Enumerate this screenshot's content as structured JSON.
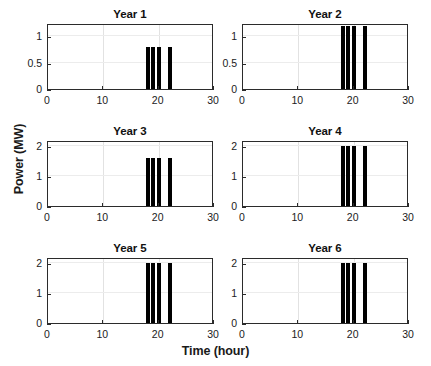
{
  "figure": {
    "xlabel": "Time (hour)",
    "ylabel": "Power (MW)",
    "bar_color": "#000000",
    "axis_color": "#2b2b2b",
    "grid_color": "#e2e2e2",
    "background": "#ffffff"
  },
  "chart_data": {
    "type": "bar",
    "title": "",
    "xlabel": "Time (hour)",
    "ylabel": "Power (MW)",
    "xlim": [
      0,
      30
    ],
    "grid": true,
    "legend": "none",
    "layout": "2 columns x 3 rows of subplots",
    "shared_xticks": [
      0,
      10,
      20,
      30
    ],
    "x": [
      18,
      19,
      20,
      22
    ],
    "panels": [
      {
        "title": "Year 1",
        "ylim": [
          0,
          1.25
        ],
        "yticks": [
          0,
          0.5,
          1
        ],
        "ytick_labels": [
          "0",
          "0.5",
          "1"
        ],
        "categories": [
          18,
          19,
          20,
          22
        ],
        "values": [
          0.8,
          0.8,
          0.8,
          0.8
        ]
      },
      {
        "title": "Year 2",
        "ylim": [
          0,
          1.25
        ],
        "yticks": [
          0,
          0.5,
          1
        ],
        "ytick_labels": [
          "0",
          "0.5",
          "1"
        ],
        "categories": [
          18,
          19,
          20,
          22
        ],
        "values": [
          1.2,
          1.2,
          1.2,
          1.2
        ]
      },
      {
        "title": "Year 3",
        "ylim": [
          0,
          2.2
        ],
        "yticks": [
          0,
          1,
          2
        ],
        "ytick_labels": [
          "0",
          "1",
          "2"
        ],
        "categories": [
          18,
          19,
          20,
          22
        ],
        "values": [
          1.6,
          1.6,
          1.6,
          1.6
        ]
      },
      {
        "title": "Year 4",
        "ylim": [
          0,
          2.2
        ],
        "yticks": [
          0,
          1,
          2
        ],
        "ytick_labels": [
          "0",
          "1",
          "2"
        ],
        "categories": [
          18,
          19,
          20,
          22
        ],
        "values": [
          2.0,
          2.0,
          2.0,
          2.0
        ]
      },
      {
        "title": "Year 5",
        "ylim": [
          0,
          2.2
        ],
        "yticks": [
          0,
          1,
          2
        ],
        "ytick_labels": [
          "0",
          "1",
          "2"
        ],
        "categories": [
          18,
          19,
          20,
          22
        ],
        "values": [
          2.0,
          2.0,
          2.0,
          2.0
        ]
      },
      {
        "title": "Year 6",
        "ylim": [
          0,
          2.2
        ],
        "yticks": [
          0,
          1,
          2
        ],
        "ytick_labels": [
          "0",
          "1",
          "2"
        ],
        "categories": [
          18,
          19,
          20,
          22
        ],
        "values": [
          2.0,
          2.0,
          2.0,
          2.0
        ]
      }
    ]
  }
}
